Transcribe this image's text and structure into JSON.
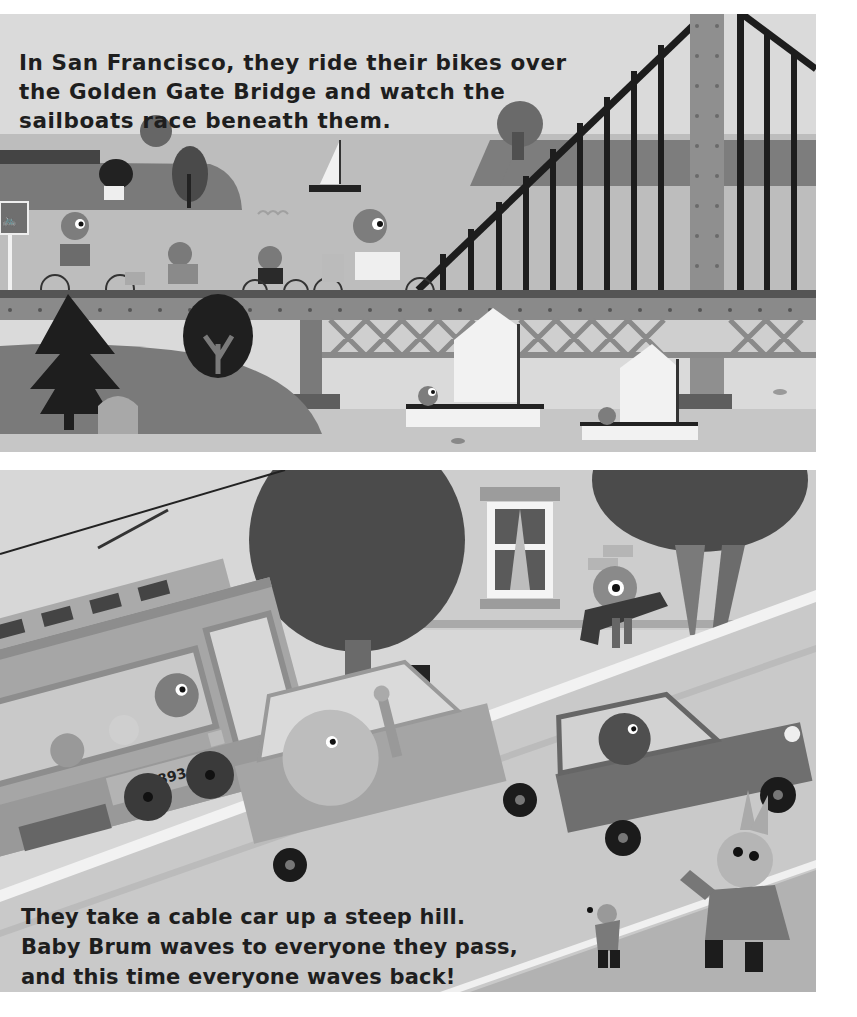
{
  "page": {
    "top_panel": {
      "caption_lines": [
        "In San Francisco, they ride their bikes over",
        "the Golden Gate Bridge and watch the",
        "sailboats race beneath them."
      ],
      "scene": {
        "setting": "Golden Gate Bridge",
        "elements": [
          "bike-sign",
          "cyclists",
          "bridge-tower",
          "suspension-cables",
          "sailboats",
          "island-with-trees",
          "pine-tree",
          "fish"
        ]
      }
    },
    "bottom_panel": {
      "caption_lines": [
        "They take a cable car up a steep hill.",
        "Baby Brum waves to everyone they pass,",
        "and this time everyone waves back!"
      ],
      "scene": {
        "cable_car_number": "1893",
        "elements": [
          "cable-car",
          "sedan-car",
          "hatchback-car",
          "trees",
          "house-window",
          "bird-waving",
          "bunny-waving",
          "mouse-waving"
        ]
      }
    },
    "colors": {
      "page_bg": "#ffffff",
      "sky": "#d9d9d9",
      "text": "#1e1e1e",
      "bridge": "#8a8a8a",
      "cables": "#222222",
      "water": "#bcbcbc",
      "road": "#b5b5b5"
    }
  }
}
